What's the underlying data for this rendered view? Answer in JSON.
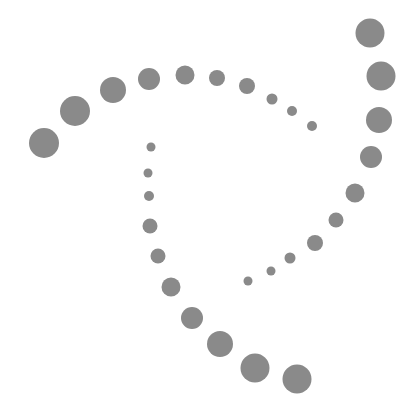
{
  "graphic": {
    "description": "Decorative logo of gray dots forming a rotating triangular swirl",
    "dot_color": "#8a8a8a",
    "background": "#ffffff",
    "dots": [
      {
        "x": 44,
        "y": 143,
        "r": 15
      },
      {
        "x": 75,
        "y": 111,
        "r": 15
      },
      {
        "x": 113,
        "y": 90,
        "r": 13
      },
      {
        "x": 149,
        "y": 79,
        "r": 11
      },
      {
        "x": 185,
        "y": 75,
        "r": 9.5
      },
      {
        "x": 217,
        "y": 78,
        "r": 8
      },
      {
        "x": 247,
        "y": 86,
        "r": 8
      },
      {
        "x": 272,
        "y": 99,
        "r": 5.5
      },
      {
        "x": 292,
        "y": 111,
        "r": 5
      },
      {
        "x": 312,
        "y": 126,
        "r": 5
      },
      {
        "x": 370,
        "y": 33,
        "r": 14.5
      },
      {
        "x": 381,
        "y": 76,
        "r": 14.5
      },
      {
        "x": 379,
        "y": 120,
        "r": 13
      },
      {
        "x": 371,
        "y": 157,
        "r": 11
      },
      {
        "x": 355,
        "y": 193,
        "r": 9.5
      },
      {
        "x": 336,
        "y": 220,
        "r": 7.5
      },
      {
        "x": 315,
        "y": 243,
        "r": 8
      },
      {
        "x": 290,
        "y": 258,
        "r": 5.5
      },
      {
        "x": 271,
        "y": 271,
        "r": 4.5
      },
      {
        "x": 248,
        "y": 281,
        "r": 4.5
      },
      {
        "x": 151,
        "y": 147,
        "r": 4.5
      },
      {
        "x": 148,
        "y": 173,
        "r": 4.5
      },
      {
        "x": 149,
        "y": 196,
        "r": 5
      },
      {
        "x": 150,
        "y": 226,
        "r": 7.5
      },
      {
        "x": 158,
        "y": 256,
        "r": 7.5
      },
      {
        "x": 171,
        "y": 287,
        "r": 9.5
      },
      {
        "x": 192,
        "y": 318,
        "r": 11
      },
      {
        "x": 220,
        "y": 344,
        "r": 13
      },
      {
        "x": 255,
        "y": 368,
        "r": 14.5
      },
      {
        "x": 297,
        "y": 379,
        "r": 14.5
      }
    ]
  }
}
